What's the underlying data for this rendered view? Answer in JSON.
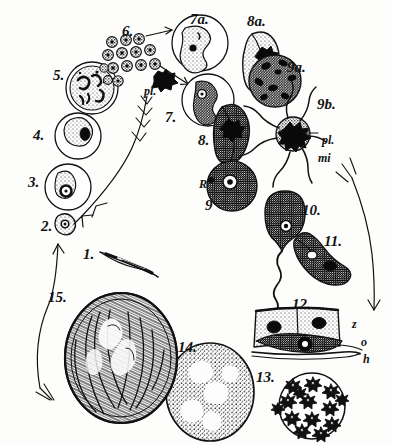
{
  "plate": {
    "title": "Malaria parasite life cycle plate",
    "background_color": "#fdfdfb",
    "ink_color": "#111111",
    "width": 393,
    "height": 445
  },
  "stage_labels": [
    {
      "id": "1",
      "text": "1.",
      "x": 83,
      "y": 247,
      "size": "num",
      "desc": "sporozoite"
    },
    {
      "id": "2",
      "text": "2.",
      "x": 41,
      "y": 219,
      "size": "num",
      "desc": "young intracellular parasite"
    },
    {
      "id": "3",
      "text": "3.",
      "x": 28,
      "y": 175,
      "size": "num",
      "desc": "ring form in red cell"
    },
    {
      "id": "4",
      "text": "4.",
      "x": 33,
      "y": 128,
      "size": "num",
      "desc": "ameboid trophozoite"
    },
    {
      "id": "5",
      "text": "5.",
      "x": 53,
      "y": 68,
      "size": "num",
      "desc": "schizont"
    },
    {
      "id": "6",
      "text": "6.",
      "x": 122,
      "y": 24,
      "size": "num",
      "desc": "merozoites"
    },
    {
      "id": "7",
      "text": "7.",
      "x": 165,
      "y": 110,
      "size": "num",
      "desc": "infected red cell"
    },
    {
      "id": "7a",
      "text": "7a.",
      "x": 190,
      "y": 12,
      "size": "num",
      "desc": "infected red cell"
    },
    {
      "id": "8",
      "text": "8.",
      "x": 198,
      "y": 133,
      "size": "num",
      "desc": "dark crescent gametocyte"
    },
    {
      "id": "8a",
      "text": "8a.",
      "x": 247,
      "y": 14,
      "size": "num",
      "desc": "pale crescent gametocyte"
    },
    {
      "id": "9",
      "text": "9",
      "x": 205,
      "y": 198,
      "size": "num",
      "desc": "female gamete (macrogamete)"
    },
    {
      "id": "9a",
      "text": "9a.",
      "x": 287,
      "y": 60,
      "size": "num",
      "desc": "rounded gametocyte"
    },
    {
      "id": "9b",
      "text": "9b.",
      "x": 317,
      "y": 97,
      "size": "num",
      "desc": "exflagellating microgametocyte"
    },
    {
      "id": "10",
      "text": "10.",
      "x": 302,
      "y": 203,
      "size": "num",
      "desc": "zygote"
    },
    {
      "id": "11",
      "text": "11.",
      "x": 324,
      "y": 234,
      "size": "num",
      "desc": "ookinete"
    },
    {
      "id": "12",
      "text": "12.",
      "x": 292,
      "y": 297,
      "size": "num",
      "desc": "ookinete in stomach wall"
    },
    {
      "id": "13",
      "text": "13.",
      "x": 256,
      "y": 370,
      "size": "num",
      "desc": "oocyst with sporoblasts"
    },
    {
      "id": "14",
      "text": "14.",
      "x": 178,
      "y": 340,
      "size": "num",
      "desc": "growing oocyst"
    },
    {
      "id": "15",
      "text": "15.",
      "x": 48,
      "y": 290,
      "size": "num",
      "desc": "mature oocyst with sporozoites"
    }
  ],
  "annotation_labels": [
    {
      "id": "pl-6",
      "text": "pl.",
      "x": 144,
      "y": 85,
      "style": "ital",
      "desc": "pigment of merozoite group"
    },
    {
      "id": "pl-9b",
      "text": "pl.",
      "x": 322,
      "y": 134,
      "style": "ital",
      "desc": "pigment in microgametocyte"
    },
    {
      "id": "mi",
      "text": "mi",
      "x": 318,
      "y": 152,
      "style": "ital",
      "desc": "microgametes"
    },
    {
      "id": "R",
      "text": "R",
      "x": 199,
      "y": 178,
      "style": "let",
      "desc": "red blood cell remnant"
    },
    {
      "id": "z",
      "text": "z",
      "x": 352,
      "y": 318,
      "style": "let",
      "desc": "stomach epithelium cell"
    },
    {
      "id": "o",
      "text": "o",
      "x": 361,
      "y": 336,
      "style": "let",
      "desc": "ookinete"
    },
    {
      "id": "h",
      "text": "h",
      "x": 363,
      "y": 353,
      "style": "let",
      "desc": "basement membrane"
    }
  ]
}
